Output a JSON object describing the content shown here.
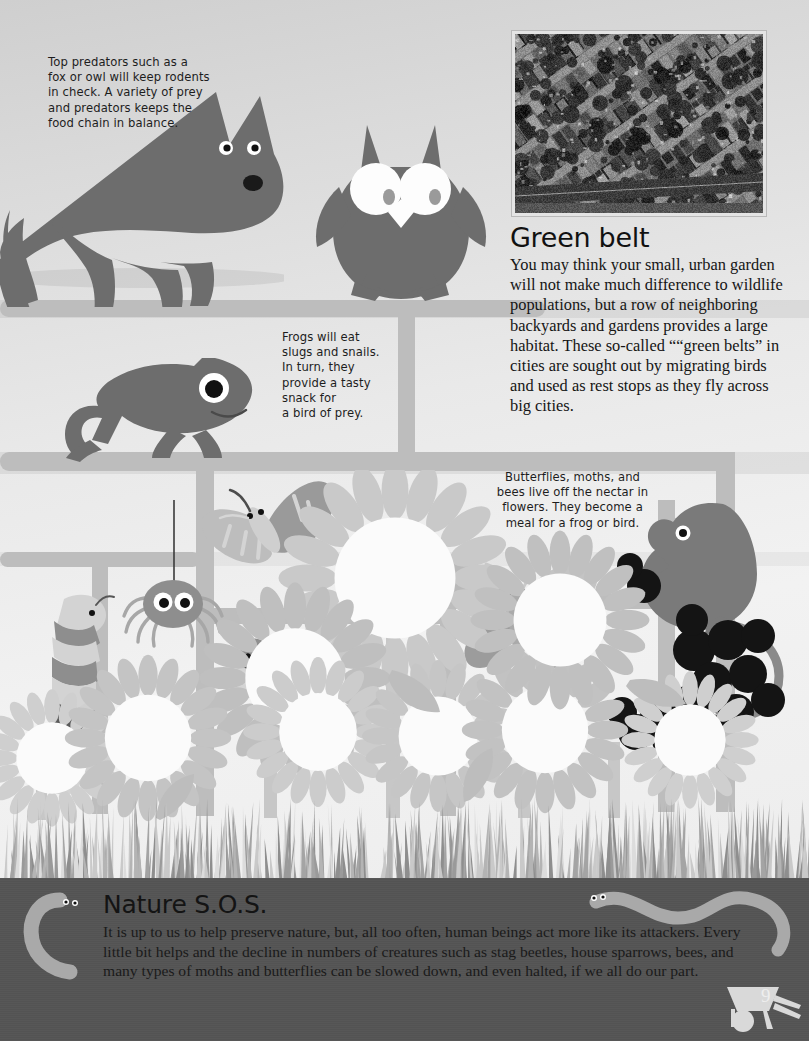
{
  "page": {
    "number": "9",
    "background_color": "#e8e8e8",
    "ground_color": "#545454",
    "accent_color": "#6b6b6b"
  },
  "captions": {
    "top_predators": "Top predators such as a\nfox or owl will keep rodents\nin check.  A variety of prey\nand predators keeps the\nfood chain in balance.",
    "frogs": "Frogs will eat\nslugs and snails.\nIn turn, they\nprovide a tasty\nsnack for\na bird of prey.",
    "pollinators": "Butterflies, moths, and\nbees live off the nectar in\nflowers. They become a\nmeal for a frog or bird."
  },
  "green_belt": {
    "title": "Green belt",
    "body": "You may think your small, urban garden will not make much difference to wildlife populations, but a row of neighboring backyards and gardens provides a large habitat. These so-called ““green belts” in cities are sought out by migrating birds and used as rest stops as they fly across big cities."
  },
  "nature_sos": {
    "title": "Nature S.O.S.",
    "body": "It is up to us to help preserve nature, but, all too often, human beings act more like its attackers. Every little bit helps and the decline in numbers of creatures such as stag beetles, house sparrows, bees, and many types of moths and butterflies can be slowed down, and even halted, if we all do our part."
  },
  "photo": {
    "alt": "Aerial black and white photograph of suburban streets with rows of houses and backyard gardens"
  },
  "illustrations": {
    "fox": "fox-silhouette",
    "owl": "owl-silhouette",
    "frog": "frog-silhouette",
    "mouse": "mouse-silhouette",
    "butterfly": "butterfly-illustration",
    "moth": "moth-illustration",
    "bee": "bee-illustration",
    "spider": "spider-illustration",
    "caterpillar": "caterpillar-illustration",
    "worm_left": "worm-illustration",
    "worm_right": "worm-illustration",
    "berries": "berry-cluster",
    "flowers": "sunflower-cluster",
    "grass": "grass-band",
    "wheelbarrow": "wheelbarrow-icon"
  }
}
